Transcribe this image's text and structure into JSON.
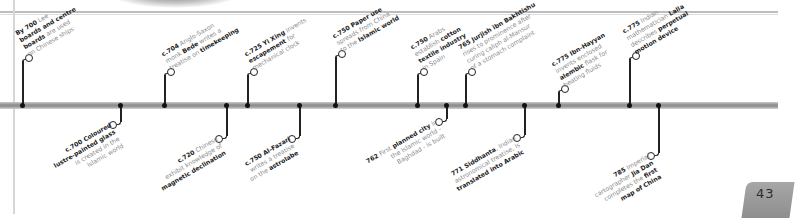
{
  "page": {
    "number": "43"
  },
  "colors": {
    "bar": "#9a9a9a",
    "stem": "#222222",
    "text_bold": "#1a1a1a",
    "text_light": "#8a8a8a",
    "badge": "#9c9c9c"
  },
  "events_above": [
    {
      "year": "By 700",
      "parts": [
        [
          "b",
          "By 700"
        ],
        [
          "t",
          " Lee"
        ],
        [
          "n",
          ""
        ],
        [
          "b",
          "boards and centre"
        ],
        [
          "n",
          ""
        ],
        [
          "b",
          "boards"
        ],
        [
          "t",
          " are used"
        ],
        [
          "n",
          ""
        ],
        [
          "t",
          "on Chinese ships"
        ]
      ]
    },
    {
      "year": "c.704",
      "parts": [
        [
          "b",
          "c.704"
        ],
        [
          "t",
          " Anglo-Saxon"
        ],
        [
          "n",
          ""
        ],
        [
          "t",
          "monk "
        ],
        [
          "b",
          "Bede"
        ],
        [
          "t",
          " writes a"
        ],
        [
          "n",
          ""
        ],
        [
          "t",
          "treatise on "
        ],
        [
          "b",
          "timekeeping"
        ]
      ]
    },
    {
      "year": "c.725",
      "parts": [
        [
          "b",
          "c.725 Yi Xing"
        ],
        [
          "t",
          " invents"
        ],
        [
          "n",
          ""
        ],
        [
          "b",
          "escapement"
        ],
        [
          "t",
          " for"
        ],
        [
          "n",
          ""
        ],
        [
          "t",
          "mechanical clock"
        ]
      ]
    },
    {
      "year": "c.750",
      "parts": [
        [
          "b",
          "c.750 Paper use"
        ],
        [
          "n",
          ""
        ],
        [
          "t",
          "spreads from China"
        ],
        [
          "n",
          ""
        ],
        [
          "t",
          "to the "
        ],
        [
          "b",
          "Islamic world"
        ]
      ]
    },
    {
      "year": "c.750",
      "parts": [
        [
          "b",
          "c.750"
        ],
        [
          "t",
          " Arabs"
        ],
        [
          "n",
          ""
        ],
        [
          "t",
          "establish "
        ],
        [
          "b",
          "cotton"
        ],
        [
          "n",
          ""
        ],
        [
          "b",
          "textile industry"
        ],
        [
          "n",
          ""
        ],
        [
          "t",
          "in Spain"
        ]
      ]
    },
    {
      "year": "765",
      "parts": [
        [
          "b",
          "765 Jurjish ibn Bakhtishu"
        ],
        [
          "n",
          ""
        ],
        [
          "t",
          "rises to prominence after"
        ],
        [
          "n",
          ""
        ],
        [
          "t",
          "curing caliph al-Mansur"
        ],
        [
          "n",
          ""
        ],
        [
          "t",
          "of a stomach complaint"
        ]
      ]
    },
    {
      "year": "c.775",
      "parts": [
        [
          "b",
          "c.775 Ibn-Hayyan"
        ],
        [
          "n",
          ""
        ],
        [
          "t",
          "invents enclosed"
        ],
        [
          "n",
          ""
        ],
        [
          "b",
          "alembic"
        ],
        [
          "t",
          " flask for"
        ],
        [
          "n",
          ""
        ],
        [
          "t",
          "heating fluids"
        ]
      ]
    },
    {
      "year": "c.775",
      "parts": [
        [
          "b",
          "c.775"
        ],
        [
          "t",
          " Indian"
        ],
        [
          "n",
          ""
        ],
        [
          "t",
          "mathematician "
        ],
        [
          "b",
          "Lalla"
        ],
        [
          "n",
          ""
        ],
        [
          "t",
          "describes "
        ],
        [
          "b",
          "perpetual"
        ],
        [
          "n",
          ""
        ],
        [
          "b",
          "motion device"
        ]
      ]
    }
  ],
  "events_below": [
    {
      "year": "c.700",
      "parts": [
        [
          "b",
          "c.700"
        ],
        [
          "b",
          " Coloured"
        ],
        [
          "n",
          ""
        ],
        [
          "b",
          "lustre-painted glass"
        ],
        [
          "n",
          ""
        ],
        [
          "t",
          "is created in the"
        ],
        [
          "n",
          ""
        ],
        [
          "t",
          "Islamic world"
        ]
      ]
    },
    {
      "year": "c.720",
      "parts": [
        [
          "b",
          "c.720"
        ],
        [
          "t",
          " Chinese"
        ],
        [
          "n",
          ""
        ],
        [
          "t",
          "exhibit knowledge of"
        ],
        [
          "n",
          ""
        ],
        [
          "b",
          "magnetic declination"
        ]
      ]
    },
    {
      "year": "c.750",
      "parts": [
        [
          "b",
          "c.750 Al-Fazari"
        ],
        [
          "n",
          ""
        ],
        [
          "t",
          "writes a treatise"
        ],
        [
          "n",
          ""
        ],
        [
          "t",
          "on the "
        ],
        [
          "b",
          "astrolabe"
        ]
      ]
    },
    {
      "year": "762",
      "parts": [
        [
          "b",
          "762"
        ],
        [
          "t",
          " First "
        ],
        [
          "b",
          "planned city"
        ],
        [
          "t",
          " in"
        ],
        [
          "n",
          ""
        ],
        [
          "t",
          "the Islamic world -"
        ],
        [
          "n",
          ""
        ],
        [
          "t",
          "Baghdad - is built"
        ]
      ]
    },
    {
      "year": "771",
      "parts": [
        [
          "b",
          "771 Siddhanta"
        ],
        [
          "t",
          ", Indian"
        ],
        [
          "n",
          ""
        ],
        [
          "t",
          "astronomical treatise, is"
        ],
        [
          "n",
          ""
        ],
        [
          "b",
          "translated into Arabic"
        ]
      ]
    },
    {
      "year": "785",
      "parts": [
        [
          "b",
          "785"
        ],
        [
          "t",
          " Imperial"
        ],
        [
          "n",
          ""
        ],
        [
          "t",
          "cartographer "
        ],
        [
          "b",
          "Jia Dan"
        ],
        [
          "n",
          ""
        ],
        [
          "t",
          "completes the "
        ],
        [
          "b",
          "first"
        ],
        [
          "n",
          ""
        ],
        [
          "b",
          "map of China"
        ]
      ]
    }
  ],
  "positions_above": [
    {
      "x": 22,
      "cy": 57,
      "lx": 30,
      "ly": 58
    },
    {
      "x": 164,
      "cy": 71,
      "lx": 172,
      "ly": 72
    },
    {
      "x": 247,
      "cy": 71,
      "lx": 255,
      "ly": 72
    },
    {
      "x": 335,
      "cy": 53,
      "lx": 343,
      "ly": 54
    },
    {
      "x": 417,
      "cy": 71,
      "lx": 425,
      "ly": 72
    },
    {
      "x": 465,
      "cy": 71,
      "lx": 473,
      "ly": 72
    },
    {
      "x": 558,
      "cy": 88,
      "lx": 566,
      "ly": 89
    },
    {
      "x": 629,
      "cy": 55,
      "lx": 637,
      "ly": 56
    }
  ],
  "positions_below": [
    {
      "x": 120,
      "cy": 124,
      "lx": 109,
      "ly": 121
    },
    {
      "x": 226,
      "cy": 138,
      "lx": 215,
      "ly": 135
    },
    {
      "x": 299,
      "cy": 138,
      "lx": 288,
      "ly": 135
    },
    {
      "x": 446,
      "cy": 121,
      "lx": 435,
      "ly": 118
    },
    {
      "x": 524,
      "cy": 137,
      "lx": 513,
      "ly": 134
    },
    {
      "x": 658,
      "cy": 155,
      "lx": 647,
      "ly": 152
    }
  ]
}
